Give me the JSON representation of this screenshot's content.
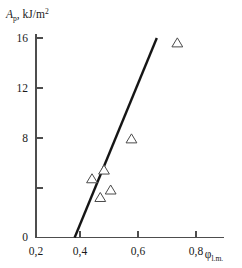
{
  "chart_data": {
    "type": "scatter",
    "title": "",
    "subtitle": "",
    "ylabel_main": "A",
    "ylabel_sub": "p",
    "ylabel_units_pre": ", kJ/m",
    "ylabel_units_sup": "2",
    "ylabel_full": "Ap, kJ/m2",
    "xlabel_main": "φ",
    "xlabel_sub": "l.m.",
    "xlabel_full": "φl.m.",
    "xlim": [
      0.2,
      0.86
    ],
    "ylim": [
      0,
      16.8
    ],
    "xticks": [
      0.2,
      0.4,
      0.6,
      0.8
    ],
    "xticklabels": [
      "0,2",
      "0,4",
      "0,6",
      "0,8"
    ],
    "yticks": [
      0,
      4,
      8,
      12,
      16
    ],
    "yticklabels": [
      "0",
      "",
      "8",
      "12",
      "16"
    ],
    "grid": false,
    "legend": "none",
    "decimal_separator": ",",
    "marker": "triangle-up-open",
    "x": [
      0.41,
      0.441,
      0.455,
      0.48,
      0.558,
      0.73
    ],
    "y": [
      4.7,
      3.2,
      5.4,
      3.8,
      7.9,
      15.6
    ],
    "points": [
      {
        "x": 0.41,
        "y": 4.7
      },
      {
        "x": 0.441,
        "y": 3.2
      },
      {
        "x": 0.455,
        "y": 5.4
      },
      {
        "x": 0.48,
        "y": 3.8
      },
      {
        "x": 0.558,
        "y": 7.9
      },
      {
        "x": 0.73,
        "y": 15.6
      }
    ],
    "series": [
      {
        "name": "measurements",
        "type": "scatter",
        "marker": "triangle-up-open",
        "values": [
          {
            "x": 0.41,
            "y": 4.7
          },
          {
            "x": 0.441,
            "y": 3.2
          },
          {
            "x": 0.455,
            "y": 5.4
          },
          {
            "x": 0.48,
            "y": 3.8
          },
          {
            "x": 0.558,
            "y": 7.9
          },
          {
            "x": 0.73,
            "y": 15.6
          }
        ]
      },
      {
        "name": "linear-fit",
        "type": "line",
        "x_start": 0.345,
        "y_start": 0.0,
        "x_end": 0.653,
        "y_end": 16.0,
        "color": "#151515"
      }
    ],
    "fit_line": {
      "x_start": 0.345,
      "y_start": 0.0,
      "x_end": 0.653,
      "y_end": 16.0,
      "x_intercept": 0.345
    },
    "colors": {
      "axis": "#4d4d4d",
      "line": "#151515",
      "marker_stroke": "#4a4a4a",
      "marker_fill": "#ffffff",
      "text": "#1a1a1a",
      "background": "#ffffff"
    }
  }
}
